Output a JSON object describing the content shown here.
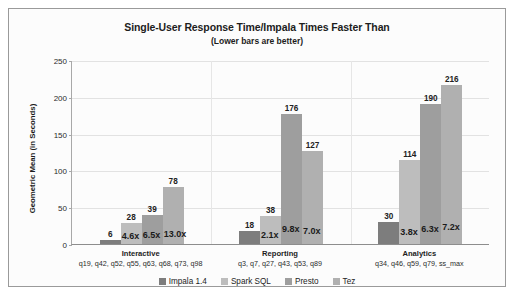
{
  "chart_data": {
    "type": "bar",
    "title": "Single-User Response Time/Impala Times Faster Than",
    "subtitle": "(Lower bars are better)",
    "xlabel": "",
    "ylabel": "Geometric Mean (in Seconds)",
    "ylim": [
      0,
      250
    ],
    "yticks": [
      0,
      50,
      100,
      150,
      200,
      250
    ],
    "grid": true,
    "legend_position": "bottom",
    "categories": [
      "Interactive",
      "Reporting",
      "Analytics"
    ],
    "category_queries": [
      "q19, q42, q52, q55, q63, q68, q73, q98",
      "q3, q7, q27, q43, q53, q89",
      "q34, q46, q59, q79, ss_max"
    ],
    "series": [
      {
        "name": "Impala 1.4",
        "color": "#7d7d7d",
        "values": [
          6,
          18,
          30
        ],
        "multipliers": [
          "",
          "",
          ""
        ]
      },
      {
        "name": "Spark SQL",
        "color": "#bdbdbd",
        "values": [
          28,
          38,
          114
        ],
        "multipliers": [
          "4.6x",
          "2.1x",
          "3.8x"
        ]
      },
      {
        "name": "Presto",
        "color": "#9e9e9e",
        "values": [
          39,
          176,
          190
        ],
        "multipliers": [
          "6.5x",
          "9.8x",
          "6.3x"
        ]
      },
      {
        "name": "Tez",
        "color": "#b0b0b0",
        "values": [
          78,
          127,
          216
        ],
        "multipliers": [
          "13.0x",
          "7.0x",
          "7.2x"
        ]
      }
    ]
  }
}
